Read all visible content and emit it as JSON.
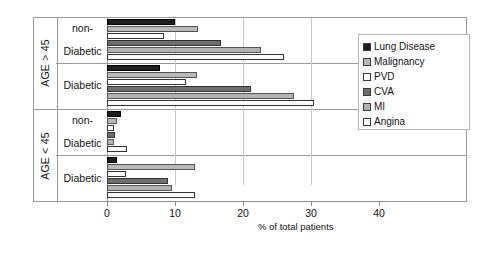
{
  "chart_data": {
    "type": "bar",
    "orientation": "horizontal",
    "title": "",
    "xlabel": "% of total patients",
    "ylabel": "",
    "xlim": [
      0,
      40
    ],
    "xticks": [
      0,
      10,
      20,
      30,
      40
    ],
    "xtick_labels": [
      "0",
      "10",
      "20",
      "30",
      "40"
    ],
    "grid": true,
    "grid_axis": "x",
    "legend_position": "right",
    "categories": [
      "AGE > 45 / non-Diabetic",
      "AGE > 45 / Diabetic",
      "AGE < 45 / non-Diabetic",
      "AGE < 45 / Diabetic"
    ],
    "group_labels": [
      {
        "age": "AGE > 45",
        "status": "non-Diabetic"
      },
      {
        "age": "AGE > 45",
        "status": "Diabetic"
      },
      {
        "age": "AGE < 45",
        "status": "non-Diabetic"
      },
      {
        "age": "AGE < 45",
        "status": "Diabetic"
      }
    ],
    "series": [
      {
        "name": "Lung Disease",
        "color": "#1d1d1d",
        "values": [
          10.0,
          7.8,
          2.0,
          1.5
        ]
      },
      {
        "name": "Malignancy",
        "color": "#b9b9b9",
        "values": [
          13.4,
          13.2,
          1.5,
          13.0
        ]
      },
      {
        "name": "PVD",
        "color": "#ffffff",
        "values": [
          8.4,
          11.6,
          1.0,
          2.8
        ]
      },
      {
        "name": "CVA",
        "color": "#6e6e6e",
        "values": [
          16.8,
          21.2,
          1.2,
          9.0
        ]
      },
      {
        "name": "MI",
        "color": "#b2b2b2",
        "values": [
          22.6,
          27.5,
          1.0,
          9.5
        ]
      },
      {
        "name": "Angina",
        "color": "#fbfbfb",
        "values": [
          26.0,
          30.5,
          3.0,
          13.0
        ]
      }
    ]
  },
  "axis": {
    "x_title": "% of total patients",
    "tick_labels": [
      "0",
      "10",
      "20",
      "30",
      "40"
    ]
  },
  "rows": [
    {
      "age": "AGE > 45",
      "status_lines": [
        "non-",
        "Diabetic"
      ]
    },
    {
      "age": "AGE > 45",
      "status_lines": [
        "Diabetic"
      ]
    },
    {
      "age": "AGE < 45",
      "status_lines": [
        "non-",
        "Diabetic"
      ]
    },
    {
      "age": "AGE < 45",
      "status_lines": [
        "Diabetic"
      ]
    }
  ],
  "legend": {
    "items": [
      {
        "label": "Lung Disease",
        "color": "#1d1d1d"
      },
      {
        "label": "Malignancy",
        "color": "#b9b9b9"
      },
      {
        "label": "PVD",
        "color": "#ffffff"
      },
      {
        "label": "CVA",
        "color": "#6e6e6e"
      },
      {
        "label": "MI",
        "color": "#b2b2b2"
      },
      {
        "label": "Angina",
        "color": "#fbfbfb"
      }
    ]
  }
}
